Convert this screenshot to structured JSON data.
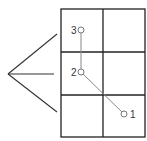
{
  "diagram": {
    "grid": {
      "cols": 2,
      "rows": 3,
      "x": 61,
      "y": 9,
      "cell_w": 42,
      "cell_h": 43,
      "stroke": "#222222"
    },
    "fan": {
      "apex": [
        8,
        74
      ],
      "ends": [
        [
          57,
          34
        ],
        [
          54,
          74
        ],
        [
          57,
          112
        ]
      ],
      "stroke": "#333333"
    },
    "path": {
      "stroke": "#888888"
    },
    "nodes": [
      {
        "id": "1",
        "label": "1",
        "cx": 124,
        "cy": 114
      },
      {
        "id": "2",
        "label": "2",
        "cx": 81,
        "cy": 72
      },
      {
        "id": "3",
        "label": "3",
        "cx": 81,
        "cy": 30
      }
    ]
  }
}
